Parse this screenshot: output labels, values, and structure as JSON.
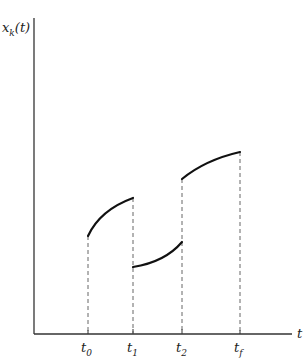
{
  "diagram": {
    "y_axis_label": "x",
    "y_axis_label_sub": "k",
    "y_axis_label_arg": "(t)",
    "x_axis_label": "t",
    "ticks": [
      {
        "base": "t",
        "sub": "0"
      },
      {
        "base": "t",
        "sub": "1"
      },
      {
        "base": "t",
        "sub": "2"
      },
      {
        "base": "t",
        "sub": "f"
      }
    ],
    "colors": {
      "curve": "#111111",
      "axis": "#333333",
      "dashed": "#555555"
    }
  }
}
